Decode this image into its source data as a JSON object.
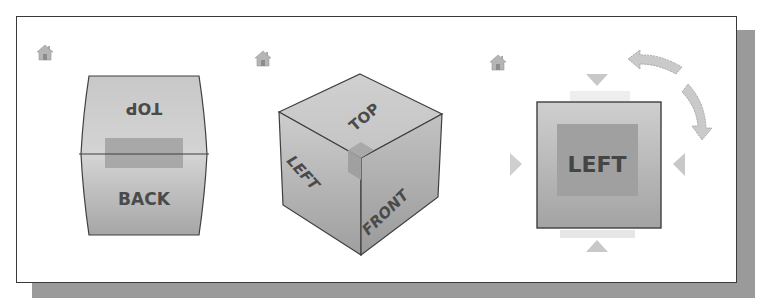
{
  "viewcubes": [
    {
      "id": "barrel",
      "home_icon": "home-icon",
      "faces": {
        "upper_label": "TOP",
        "lower_label": "BACK"
      }
    },
    {
      "id": "isometric",
      "home_icon": "home-icon",
      "faces": {
        "top_label": "TOP",
        "left_label": "LEFT",
        "front_label": "FRONT"
      }
    },
    {
      "id": "flat",
      "home_icon": "home-icon",
      "faces": {
        "front_label": "LEFT"
      },
      "controls": [
        "triangle-up",
        "triangle-down",
        "triangle-left",
        "triangle-right",
        "rotate-ccw-arrow",
        "rotate-cw-arrow"
      ]
    }
  ],
  "colors": {
    "frame_border": "#3a3a3a",
    "shadow": "#9a9a9a",
    "cube_light": "#d6d6d6",
    "cube_mid": "#bdbdbd",
    "cube_dark": "#9e9e9e",
    "highlight": "#a4a4a4",
    "label": "#4a4a4a",
    "arrow": "#c8c8c8"
  }
}
